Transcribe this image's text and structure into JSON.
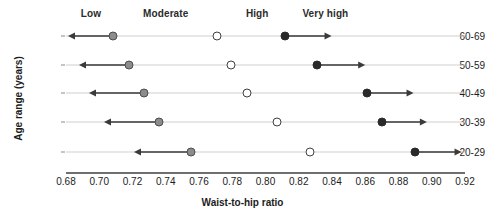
{
  "chart_data": {
    "type": "scatter",
    "title": "",
    "xlabel": "Waist-to-hip ratio",
    "ylabel": "Age range (years)",
    "xlim": [
      0.68,
      0.92
    ],
    "xticks": [
      "0.68",
      "0.70",
      "0.72",
      "0.74",
      "0.76",
      "0.78",
      "0.80",
      "0.82",
      "0.84",
      "0.86",
      "0.88",
      "0.90",
      "0.92"
    ],
    "xtick_values": [
      0.68,
      0.7,
      0.72,
      0.74,
      0.76,
      0.78,
      0.8,
      0.82,
      0.84,
      0.86,
      0.88,
      0.9,
      0.92
    ],
    "categories": [
      "60-69",
      "50-59",
      "40-49",
      "30-39",
      "20-29"
    ],
    "grid": true,
    "legend_position": "top",
    "risk_bands": [
      {
        "name": "Low",
        "label_x": 0.695
      },
      {
        "name": "Moderate",
        "label_x": 0.74
      },
      {
        "name": "High",
        "label_x": 0.795
      },
      {
        "name": "Very high",
        "label_x": 0.836
      }
    ],
    "series": [
      {
        "name": "Low",
        "marker": "filled-gray-circle",
        "color": "#8c8c8c",
        "direction": "left",
        "values": [
          0.708,
          0.718,
          0.727,
          0.736,
          0.755
        ],
        "arrow_end": [
          0.681,
          0.688,
          0.694,
          0.703,
          0.721
        ]
      },
      {
        "name": "Moderate",
        "marker": "open-circle",
        "color": "#ffffff",
        "direction": "none",
        "values": [
          0.771,
          0.779,
          0.789,
          0.807,
          0.827
        ],
        "arrow_end": [
          null,
          null,
          null,
          null,
          null
        ]
      },
      {
        "name": "High / Very high boundary",
        "marker": "filled-black-circle",
        "color": "#2a2a2a",
        "direction": "right",
        "values": [
          0.812,
          0.831,
          0.861,
          0.87,
          0.89
        ],
        "arrow_end": [
          0.84,
          0.86,
          0.889,
          0.897,
          0.918
        ]
      }
    ],
    "rows": [
      {
        "age": "60-69",
        "low": 0.708,
        "moderate": 0.771,
        "very_high": 0.812
      },
      {
        "age": "50-59",
        "low": 0.718,
        "moderate": 0.779,
        "very_high": 0.831
      },
      {
        "age": "40-49",
        "low": 0.727,
        "moderate": 0.789,
        "very_high": 0.861
      },
      {
        "age": "30-39",
        "low": 0.736,
        "moderate": 0.807,
        "very_high": 0.87
      },
      {
        "age": "20-29",
        "low": 0.755,
        "moderate": 0.827,
        "very_high": 0.89
      }
    ]
  },
  "axis": {
    "x_title": "Waist-to-hip ratio",
    "y_title": "Age range (years)"
  }
}
